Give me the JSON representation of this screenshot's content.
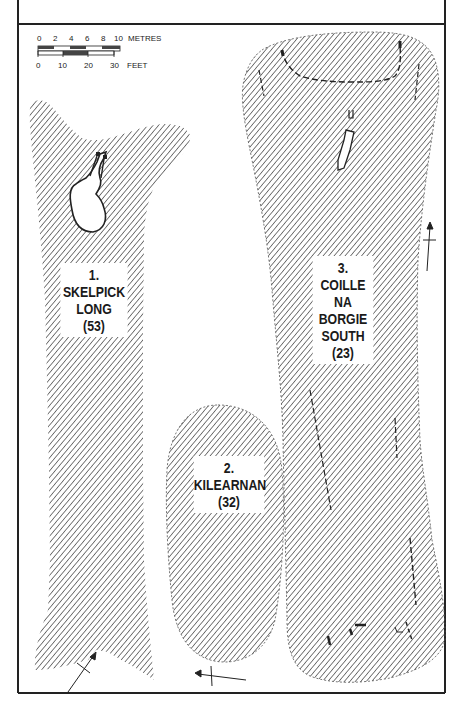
{
  "figure": {
    "scale_bar": {
      "metres_ticks": [
        "0",
        "2",
        "4",
        "6",
        "8",
        "10"
      ],
      "metres_unit": "METRES",
      "feet_ticks": [
        "0",
        "10",
        "20",
        "30"
      ],
      "feet_unit": "FEET"
    },
    "sites": [
      {
        "number": "1.",
        "name_lines": [
          "SKELPICK",
          "LONG"
        ],
        "ref": "(53)"
      },
      {
        "number": "2.",
        "name_lines": [
          "KILEARNAN"
        ],
        "ref": "(32)"
      },
      {
        "number": "3.",
        "name_lines": [
          "COILLE",
          "NA",
          "BORGIE",
          "SOUTH"
        ],
        "ref": "(23)"
      }
    ],
    "colors": {
      "ink": "#222222",
      "hatch": "#3a3a3a",
      "paper": "#ffffff"
    }
  }
}
